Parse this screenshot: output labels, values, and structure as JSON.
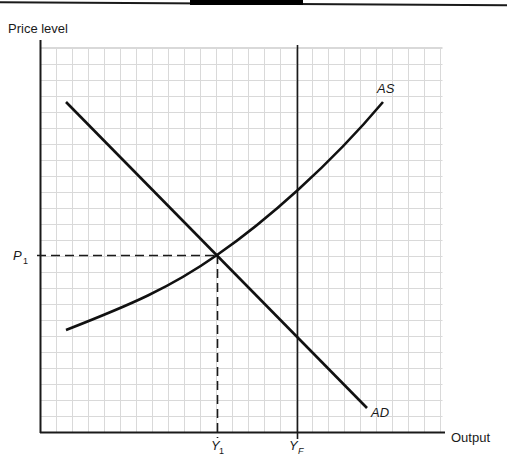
{
  "chart_data": {
    "type": "line",
    "title": "",
    "xlabel": "Output",
    "ylabel": "Price level",
    "grid": true,
    "legend": "none (inline curve labels)",
    "x_ticks": [
      {
        "label": "Y",
        "sub": "1",
        "x_px": 217
      },
      {
        "label": "Y",
        "sub": "F",
        "x_px": 297
      }
    ],
    "y_ticks": [
      {
        "label": "P",
        "sub": "1",
        "y_px": 255
      }
    ],
    "series": [
      {
        "name": "AS",
        "shape": "convex upward-sloping curve",
        "points_px": [
          [
            66,
            330
          ],
          [
            140,
            298
          ],
          [
            217,
            255
          ],
          [
            297,
            188
          ],
          [
            383,
            102
          ]
        ]
      },
      {
        "name": "AD",
        "shape": "downward-sloping straight line",
        "points_px": [
          [
            66,
            102
          ],
          [
            217,
            255
          ],
          [
            297,
            336
          ],
          [
            367,
            408
          ]
        ]
      }
    ],
    "annotations": [
      {
        "type": "vertical_line",
        "label": "YF",
        "x_px": 297,
        "style": "solid"
      },
      {
        "type": "dashed_line",
        "from": "P1 on y-axis",
        "to": "AS/AD intersection",
        "y_px": 255
      },
      {
        "type": "dashed_line",
        "from": "AS/AD intersection",
        "to": "Y1 on x-axis",
        "x_px": 217
      },
      {
        "type": "equilibrium_point",
        "at": "(Y1, P1)"
      }
    ]
  },
  "labels": {
    "ylabel": "Price level",
    "xlabel": "Output",
    "as_label": "AS",
    "ad_label": "AD",
    "p1_main": "P",
    "p1_sub": "1",
    "y1_main": "Y",
    "y1_sub": "1",
    "yf_main": "Y",
    "yf_sub": "F"
  },
  "colors": {
    "axis": "#1a1a1a",
    "curve": "#111111",
    "grid": "#d9d9d9",
    "background": "#ffffff"
  }
}
